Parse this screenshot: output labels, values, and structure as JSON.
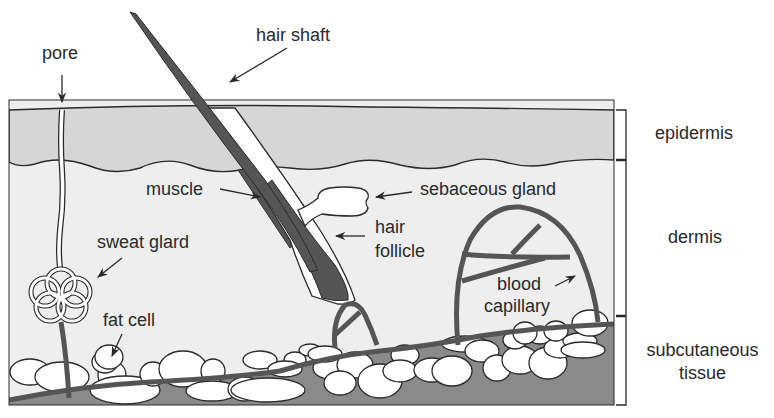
{
  "diagram": {
    "colors": {
      "background": "#ffffff",
      "epidermis": "#d6d6d6",
      "dermis": "#eeeeee",
      "subcutaneous": "#8a8a8a",
      "outline": "#2a2a2a",
      "hair_dark": "#555555",
      "fat_cell": "#ffffff",
      "text": "#2a2a2a"
    },
    "structure_labels": {
      "pore": "pore",
      "hair_shaft": "hair shaft",
      "muscle": "muscle",
      "sebaceous_gland": "sebaceous gland",
      "hair_follicle_line1": "hair",
      "hair_follicle_line2": "follicle",
      "sweat_gland": "sweat glard",
      "fat_cell": "fat cell",
      "blood_capillary_line1": "blood",
      "blood_capillary_line2": "capillary"
    },
    "layer_labels": {
      "epidermis": "epidermis",
      "dermis": "dermis",
      "subcutaneous_line1": "subcutaneous",
      "subcutaneous_line2": "tissue"
    }
  }
}
